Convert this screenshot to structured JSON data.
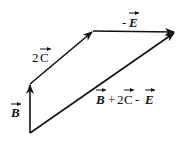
{
  "diagram": {
    "type": "vector-addition",
    "stroke_color": "#111111",
    "background": "#ffffff",
    "vectors": [
      {
        "name": "B",
        "label": "B",
        "from": [
          30,
          133
        ],
        "to": [
          30,
          84
        ]
      },
      {
        "name": "2C",
        "label": "2C",
        "from": [
          30,
          84
        ],
        "to": [
          93,
          31
        ]
      },
      {
        "name": "-E",
        "label": "-E",
        "from": [
          93,
          31
        ],
        "to": [
          175,
          32
        ]
      },
      {
        "name": "resultant",
        "label": "B + 2C - E",
        "from": [
          30,
          133
        ],
        "to": [
          175,
          32
        ]
      }
    ],
    "labels": {
      "b": {
        "coef": "",
        "letter": "B"
      },
      "two_c": {
        "coef": "2",
        "letter": "C"
      },
      "neg_e": {
        "sign": "-",
        "letter": "E"
      },
      "resultant": {
        "b": "B",
        "plus": "+",
        "two": "2",
        "c": "C",
        "minus": "-",
        "e": "E"
      }
    }
  }
}
